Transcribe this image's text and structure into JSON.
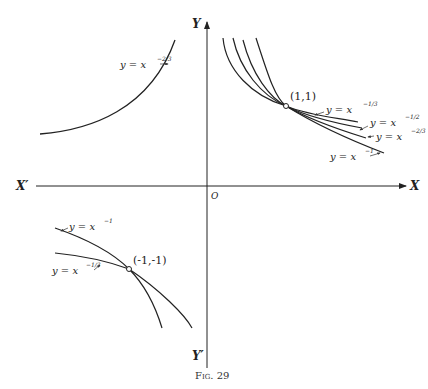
{
  "figure": {
    "caption": "Fig. 29",
    "axes": {
      "x_pos": "X",
      "x_neg": "X′",
      "y_pos": "Y",
      "y_neg": "Y′",
      "origin": "O"
    },
    "points": [
      {
        "label": "(1,1)"
      },
      {
        "label": "(-1,-1)"
      }
    ],
    "curves": {
      "q2": {
        "base": "y = x",
        "exp": "−2/3"
      },
      "q1": [
        {
          "base": "y = x",
          "exp": "−1/3"
        },
        {
          "base": "y = x",
          "exp": "−1/2"
        },
        {
          "base": "y = x",
          "exp": "−2/3"
        },
        {
          "base": "y = x",
          "exp": "−1"
        }
      ],
      "q3": [
        {
          "base": "y = x",
          "exp": "−1"
        },
        {
          "base": "y = x",
          "exp": "−1/3"
        }
      ]
    }
  }
}
